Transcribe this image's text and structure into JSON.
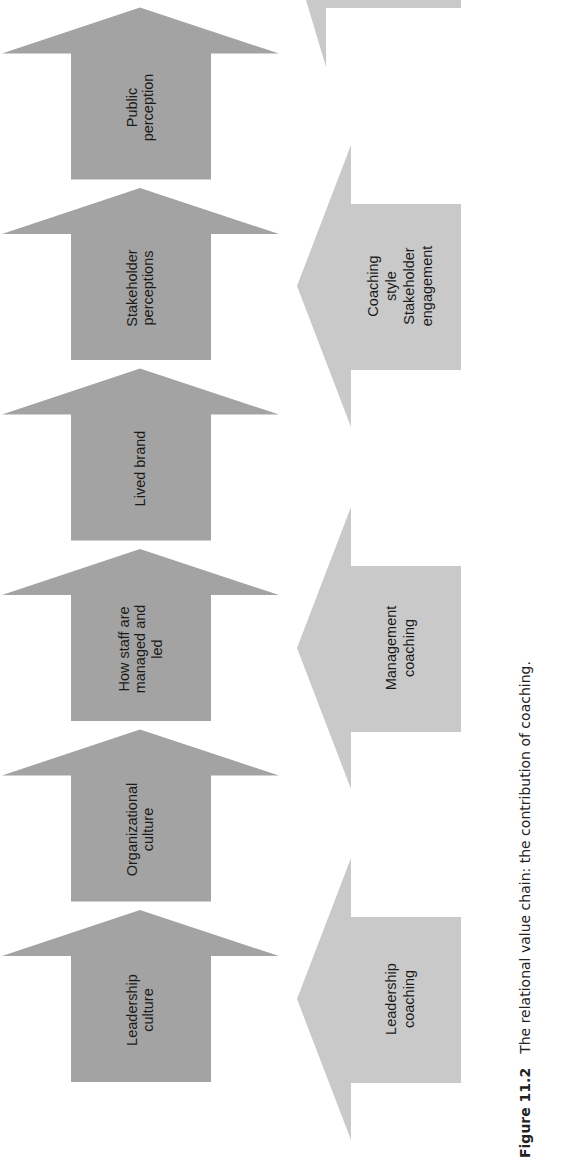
{
  "diagram": {
    "orientation": "rotated 90 degrees counter-clockwise; flow reads left-to-right when page turned",
    "value_chain": [
      {
        "id": "leadership-culture",
        "lines": [
          "Leadership",
          "culture"
        ]
      },
      {
        "id": "organizational-culture",
        "lines": [
          "Organizational",
          "culture"
        ]
      },
      {
        "id": "how-staff-managed",
        "lines": [
          "How staff are",
          "managed and",
          "led"
        ]
      },
      {
        "id": "lived-brand",
        "lines": [
          "Lived brand"
        ]
      },
      {
        "id": "stakeholder-perceptions",
        "lines": [
          "Stakeholder",
          "perceptions"
        ]
      },
      {
        "id": "public-perception",
        "lines": [
          "Public",
          "perception"
        ]
      }
    ],
    "coaching_inputs": [
      {
        "id": "leadership-coaching",
        "lines": [
          "Leadership",
          "coaching"
        ]
      },
      {
        "id": "management-coaching",
        "lines": [
          "Management",
          "coaching"
        ]
      },
      {
        "id": "coaching-style-stakeholder-engagement",
        "lines": [
          "Coaching",
          "style",
          "Stakeholder",
          "engagement"
        ]
      }
    ],
    "colors": {
      "value_chain_arrow": "#a3a3a3",
      "coaching_arrow": "#c9c9c9",
      "text": "#1a1a1a"
    }
  },
  "caption": {
    "label": "Figure 11.2",
    "text": "The relational value chain: the contribution of coaching."
  }
}
